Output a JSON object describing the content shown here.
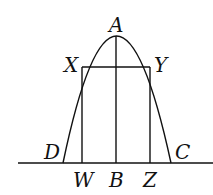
{
  "diagram": {
    "type": "parabola-inscribed-rectangle",
    "labels": {
      "A": "A",
      "X": "X",
      "Y": "Y",
      "D": "D",
      "C": "C",
      "W": "W",
      "B": "B",
      "Z": "Z"
    },
    "points": {
      "A": [
        116,
        36
      ],
      "X": [
        82,
        67
      ],
      "Y": [
        150,
        67
      ],
      "D": [
        63,
        163
      ],
      "C": [
        171,
        163
      ],
      "W": [
        82,
        163
      ],
      "B": [
        116,
        163
      ],
      "Z": [
        150,
        163
      ]
    },
    "colors": {
      "stroke": "#111111",
      "background": "#ffffff"
    }
  }
}
